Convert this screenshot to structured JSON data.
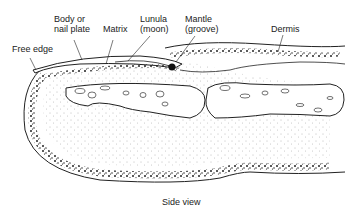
{
  "diagram": {
    "title": "Side view",
    "labels": {
      "free_edge": "Free edge",
      "body_line1": "Body or",
      "body_line2": "nail plate",
      "matrix": "Matrix",
      "lunula_line1": "Lunula",
      "lunula_line2": "(moon)",
      "mantle_line1": "Mantle",
      "mantle_line2": "(groove)",
      "dermis": "Dermis"
    },
    "colors": {
      "line": "#222222",
      "stipple": "#555555",
      "background": "#ffffff"
    }
  }
}
